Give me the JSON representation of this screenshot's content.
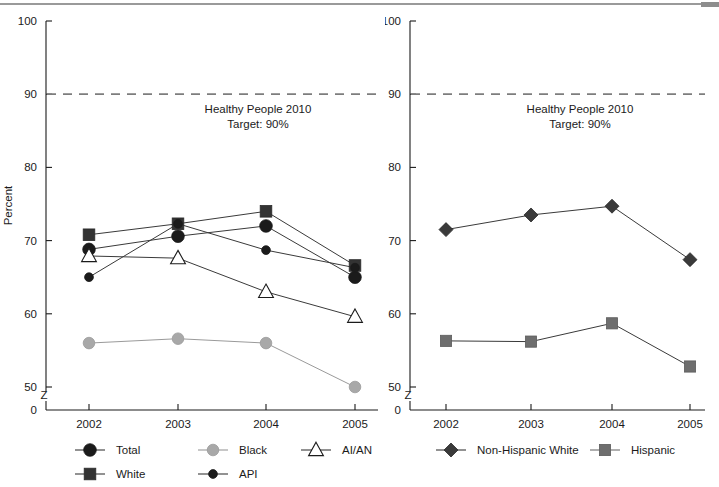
{
  "figure": {
    "top_rule": true,
    "background": "#ffffff",
    "ink": "#1b1b1b"
  },
  "chart_data": [
    {
      "id": "left",
      "type": "line",
      "title": "",
      "xlabel": "",
      "ylabel": "Percent",
      "x": [
        "2002",
        "2003",
        "2004",
        "2005"
      ],
      "ylim": [
        0,
        100
      ],
      "yticks": [
        0,
        50,
        60,
        70,
        80,
        90,
        100
      ],
      "yticklabels": [
        "0",
        "50",
        "60",
        "70",
        "80",
        "90",
        "100"
      ],
      "axis_break": true,
      "axis_break_label": "Z",
      "grid": false,
      "legend_position": "below",
      "annotation": {
        "line1": "Healthy People 2010",
        "line2": "Target: 90%"
      },
      "reference_line": {
        "value": 90,
        "label": "Healthy People 2010 Target: 90%",
        "style": "dashed",
        "color": "#7d7d7d"
      },
      "series": [
        {
          "name": "Total",
          "marker": "circle",
          "color": "#1b1b1b",
          "values": [
            68.8,
            70.6,
            72.0,
            65.0
          ]
        },
        {
          "name": "Black",
          "marker": "circle-gray",
          "color": "#a8a8a8",
          "values": [
            56.0,
            56.6,
            56.0,
            50.0
          ]
        },
        {
          "name": "AI/AN",
          "marker": "triangle-open",
          "color": "#1b1b1b",
          "values": [
            67.9,
            67.6,
            63.0,
            59.6
          ]
        },
        {
          "name": "White",
          "marker": "square",
          "color": "#333333",
          "values": [
            70.8,
            72.3,
            74.0,
            66.6
          ]
        },
        {
          "name": "API",
          "marker": "circle-small",
          "color": "#1b1b1b",
          "values": [
            65.0,
            72.3,
            68.7,
            66.3
          ]
        }
      ]
    },
    {
      "id": "right",
      "type": "line",
      "title": "",
      "xlabel": "",
      "ylabel": "Percent",
      "x": [
        "2002",
        "2003",
        "2004",
        "2005"
      ],
      "ylim": [
        0,
        100
      ],
      "yticks": [
        0,
        50,
        60,
        70,
        80,
        90,
        100
      ],
      "yticklabels": [
        "0",
        "50",
        "60",
        "70",
        "80",
        "90",
        "100"
      ],
      "axis_break": true,
      "axis_break_label": "Z",
      "grid": false,
      "legend_position": "below",
      "annotation": {
        "line1": "Healthy People 2010",
        "line2": "Target: 90%"
      },
      "reference_line": {
        "value": 90,
        "label": "Healthy People 2010 Target: 90%",
        "style": "dashed",
        "color": "#7d7d7d"
      },
      "series": [
        {
          "name": "Non-Hispanic White",
          "marker": "diamond",
          "color": "#3a3a3a",
          "values": [
            71.5,
            73.5,
            74.7,
            67.4
          ]
        },
        {
          "name": "Hispanic",
          "marker": "square",
          "color": "#6e6e6e",
          "values": [
            56.3,
            56.2,
            58.7,
            52.8
          ]
        }
      ]
    }
  ],
  "left_chart": {
    "ylabel": "Percent",
    "annotation_line1": "Healthy People 2010",
    "annotation_line2": "Target: 90%",
    "break_glyph": "Z",
    "xticks": [
      "2002",
      "2003",
      "2004",
      "2005"
    ],
    "yticks": [
      "100",
      "90",
      "80",
      "70",
      "60",
      "50",
      "0"
    ],
    "legend": [
      {
        "label": "Total",
        "marker": "circle"
      },
      {
        "label": "Black",
        "marker": "circle-gray"
      },
      {
        "label": "AI/AN",
        "marker": "triangle-open"
      },
      {
        "label": "White",
        "marker": "square"
      },
      {
        "label": "API",
        "marker": "circle-small"
      }
    ]
  },
  "right_chart": {
    "ylabel": "Percent",
    "annotation_line1": "Healthy People 2010",
    "annotation_line2": "Target: 90%",
    "break_glyph": "Z",
    "xticks": [
      "2002",
      "2003",
      "2004",
      "2005"
    ],
    "yticks": [
      "100",
      "90",
      "80",
      "70",
      "60",
      "50",
      "0"
    ],
    "legend": [
      {
        "label": "Non-Hispanic White",
        "marker": "diamond"
      },
      {
        "label": "Hispanic",
        "marker": "square"
      }
    ]
  }
}
